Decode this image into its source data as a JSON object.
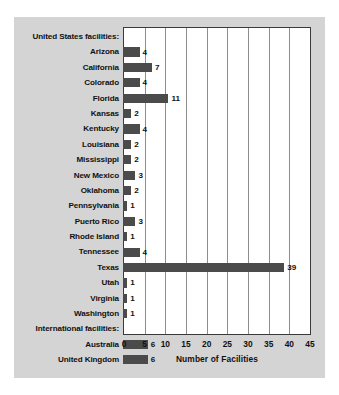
{
  "chart_data": {
    "type": "bar",
    "orientation": "horizontal",
    "title": "",
    "xlabel": "Number of Facilities",
    "ylabel": "",
    "xlim": [
      0,
      45
    ],
    "xticks": [
      0,
      5,
      10,
      15,
      20,
      25,
      30,
      35,
      40,
      45
    ],
    "grid": true,
    "legend": null,
    "bar_color": "#4b4b4b",
    "categories": [
      "United States facilities:",
      "Arizona",
      "California",
      "Colorado",
      "Florida",
      "Kansas",
      "Kentucky",
      "Louisiana",
      "Mississippi",
      "New Mexico",
      "Oklahoma",
      "Pennsylvania",
      "Puerto Rico",
      "Rhode Island",
      "Tennessee",
      "Texas",
      "Utah",
      "Virginia",
      "Washington",
      "International facilities:",
      "Australia",
      "United Kingdom"
    ],
    "values": [
      null,
      4,
      7,
      4,
      11,
      2,
      4,
      2,
      2,
      3,
      2,
      1,
      3,
      1,
      4,
      39,
      1,
      1,
      1,
      null,
      6,
      6
    ],
    "rows": [
      {
        "label": "United States facilities:",
        "value": null,
        "header": true
      },
      {
        "label": "Arizona",
        "value": 4,
        "header": false
      },
      {
        "label": "California",
        "value": 7,
        "header": false
      },
      {
        "label": "Colorado",
        "value": 4,
        "header": false
      },
      {
        "label": "Florida",
        "value": 11,
        "header": false
      },
      {
        "label": "Kansas",
        "value": 2,
        "header": false
      },
      {
        "label": "Kentucky",
        "value": 4,
        "header": false
      },
      {
        "label": "Louisiana",
        "value": 2,
        "header": false
      },
      {
        "label": "Mississippi",
        "value": 2,
        "header": false
      },
      {
        "label": "New Mexico",
        "value": 3,
        "header": false
      },
      {
        "label": "Oklahoma",
        "value": 2,
        "header": false
      },
      {
        "label": "Pennsylvania",
        "value": 1,
        "header": false
      },
      {
        "label": "Puerto Rico",
        "value": 3,
        "header": false
      },
      {
        "label": "Rhode Island",
        "value": 1,
        "header": false
      },
      {
        "label": "Tennessee",
        "value": 4,
        "header": false
      },
      {
        "label": "Texas",
        "value": 39,
        "header": false
      },
      {
        "label": "Utah",
        "value": 1,
        "header": false
      },
      {
        "label": "Virginia",
        "value": 1,
        "header": false
      },
      {
        "label": "Washington",
        "value": 1,
        "header": false
      },
      {
        "label": "International facilities:",
        "value": null,
        "header": true
      },
      {
        "label": "Australia",
        "value": 6,
        "header": false
      },
      {
        "label": "United Kingdom",
        "value": 6,
        "header": false
      }
    ]
  },
  "colors": {
    "panel_background": "#d4d4d4",
    "plot_background": "#ffffff",
    "bar": "#4b4b4b",
    "gridline": "#8d8d8d",
    "frame": "#3a3a3a",
    "text": "#111111"
  }
}
